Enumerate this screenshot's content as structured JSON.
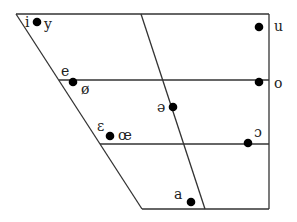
{
  "colors": {
    "line": "#333333",
    "dot": "#000000",
    "text": "#222222"
  },
  "frame": {
    "top_left": [
      16,
      14
    ],
    "top_right": [
      269,
      14
    ],
    "bottom_left": [
      142,
      209
    ],
    "bottom_right": [
      269,
      209
    ],
    "close_mid_y": 80,
    "close_mid_left_x": 59,
    "open_mid_y": 144,
    "open_mid_left_x": 100,
    "central_top_x": 141,
    "central_bottom_x": 205
  },
  "vowels": [
    {
      "symbol": "i",
      "label_x": 25,
      "label_y": 27,
      "dot": [
        37,
        22
      ],
      "anchor": "end"
    },
    {
      "symbol": "y",
      "label_x": 44,
      "label_y": 29,
      "dot": null,
      "anchor": "start"
    },
    {
      "symbol": "u",
      "label_x": 274,
      "label_y": 31,
      "dot": [
        259,
        27
      ],
      "anchor": "start"
    },
    {
      "symbol": "e",
      "label_x": 61,
      "label_y": 76,
      "dot": null,
      "anchor": "start"
    },
    {
      "symbol": "ø",
      "label_x": 81,
      "label_y": 94,
      "dot": [
        73,
        82
      ],
      "anchor": "start"
    },
    {
      "symbol": "o",
      "label_x": 274,
      "label_y": 88,
      "dot": [
        259,
        82
      ],
      "anchor": "start"
    },
    {
      "symbol": "ə",
      "label_x": 157,
      "label_y": 112,
      "dot": [
        173,
        107
      ],
      "anchor": "start"
    },
    {
      "symbol": "ɛ",
      "label_x": 97,
      "label_y": 131,
      "dot": [
        110,
        136
      ],
      "anchor": "start"
    },
    {
      "symbol": "œ",
      "label_x": 118,
      "label_y": 140,
      "dot": null,
      "anchor": "start"
    },
    {
      "symbol": "ɔ",
      "label_x": 254,
      "label_y": 137,
      "dot": [
        248,
        143
      ],
      "anchor": "start"
    },
    {
      "symbol": "a",
      "label_x": 174,
      "label_y": 199,
      "dot": [
        191,
        202
      ],
      "anchor": "start"
    }
  ]
}
